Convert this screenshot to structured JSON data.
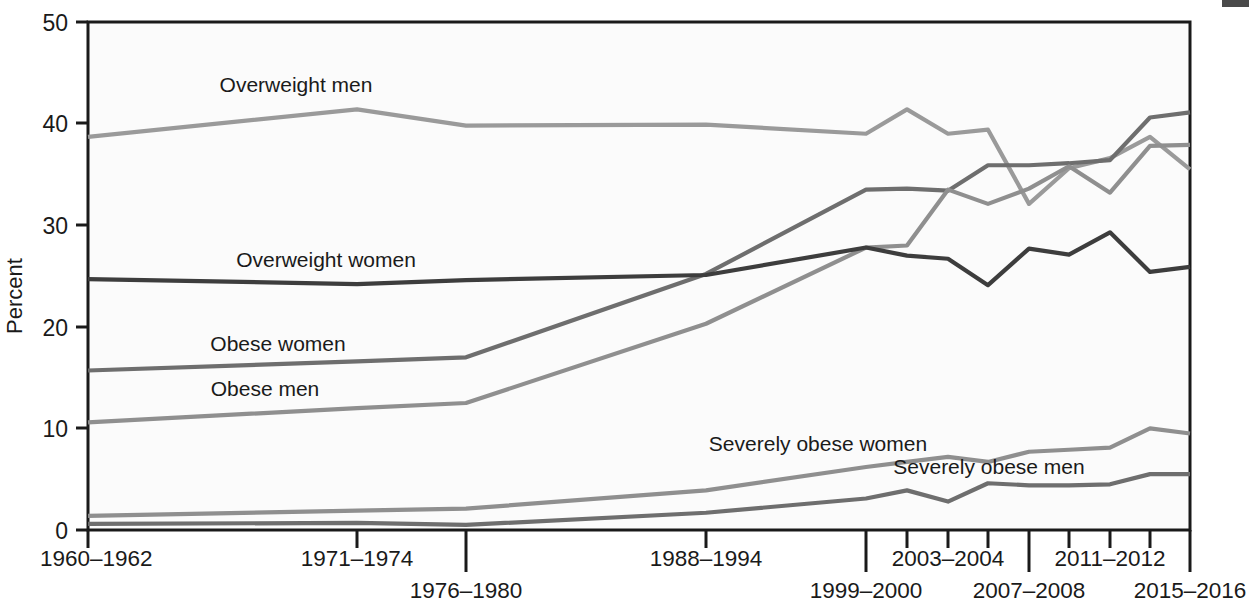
{
  "chart_data": {
    "type": "line",
    "title": "",
    "subtitle": "",
    "xlabel": "",
    "ylabel": "Percent",
    "ylim": [
      0,
      50
    ],
    "yticks": [
      0,
      10,
      20,
      30,
      40,
      50
    ],
    "ytick_labels": [
      "0",
      "10",
      "20",
      "30",
      "40",
      "50"
    ],
    "grid": false,
    "legend_position": "inline-labels",
    "x": [
      "1960-1962",
      "1971-1974",
      "1976-1980",
      "1988-1994",
      "1999-2000",
      "2001-2002",
      "2003-2004",
      "2005-2006",
      "2007-2008",
      "2009-2010",
      "2011-2012",
      "2013-2014",
      "2015-2016"
    ],
    "xtick_labels": [
      "1960–1962",
      "1971–1974",
      "1976–1980",
      "1988–1994",
      "1999–2000",
      "2003–2004",
      "2007–2008",
      "2011–2012",
      "2015–2016"
    ],
    "series": [
      {
        "name": "Overweight men",
        "label": "Overweight men",
        "color": "#9a9a9a",
        "values": [
          38.7,
          41.4,
          39.8,
          39.9,
          39.0,
          41.4,
          39.0,
          39.4,
          32.1,
          35.6,
          36.6,
          38.7,
          35.5
        ]
      },
      {
        "name": "Overweight women",
        "label": "Overweight women",
        "color": "#3d3d3d",
        "values": [
          24.7,
          24.2,
          24.6,
          25.1,
          27.8,
          27.0,
          26.7,
          24.1,
          27.7,
          27.1,
          29.3,
          25.4,
          25.9
        ]
      },
      {
        "name": "Obese women",
        "label": "Obese women",
        "color": "#6e6e6e",
        "values": [
          15.7,
          16.6,
          17.0,
          25.2,
          33.5,
          33.6,
          33.4,
          35.9,
          35.9,
          36.1,
          36.4,
          40.6,
          41.1
        ]
      },
      {
        "name": "Obese men",
        "label": "Obese men",
        "color": "#8f8f8f",
        "values": [
          10.6,
          12.0,
          12.5,
          20.3,
          27.8,
          28.0,
          33.5,
          32.1,
          33.6,
          35.8,
          33.2,
          37.8,
          37.9
        ]
      },
      {
        "name": "Severely obese women",
        "label": "Severely obese women",
        "color": "#8f8f8f",
        "values": [
          1.4,
          1.9,
          2.1,
          3.9,
          6.2,
          6.7,
          7.2,
          6.7,
          7.7,
          7.9,
          8.1,
          10.0,
          9.5
        ]
      },
      {
        "name": "Severely obese men",
        "label": "Severely obese men",
        "color": "#6e6e6e",
        "values": [
          0.6,
          0.7,
          0.5,
          1.7,
          3.1,
          3.9,
          2.8,
          4.6,
          4.4,
          4.4,
          4.5,
          5.5,
          5.5
        ]
      }
    ],
    "annotations": [
      {
        "text": "Overweight men",
        "x": 296,
        "y": 92
      },
      {
        "text": "Overweight women",
        "x": 326,
        "y": 267
      },
      {
        "text": "Obese women",
        "x": 278,
        "y": 351
      },
      {
        "text": "Obese men",
        "x": 265,
        "y": 396
      },
      {
        "text": "Severely obese women",
        "x": 818,
        "y": 451
      },
      {
        "text": "Severely obese men",
        "x": 989,
        "y": 474
      }
    ]
  },
  "axis": {
    "y_title": "Percent",
    "y_labels": [
      "50",
      "40",
      "30",
      "20",
      "10",
      "0"
    ],
    "x_labels_upper": [
      "1960–1962",
      "1971–1974",
      "1988–1994",
      "2003–2004",
      "2011–2012"
    ],
    "x_labels_lower": [
      "1976–1980",
      "1999–2000",
      "2007–2008",
      "2015–2016"
    ]
  },
  "xlabels": {
    "l0": "1960–1962",
    "l1": "1971–1974",
    "l2": "1976–1980",
    "l3": "1988–1994",
    "l4": "1999–2000",
    "l5": "2003–2004",
    "l6": "2007–2008",
    "l7": "2011–2012",
    "l8": "2015–2016"
  },
  "ylabels": {
    "y50": "50",
    "y40": "40",
    "y30": "30",
    "y20": "20",
    "y10": "10",
    "y0": "0"
  },
  "series_labels": {
    "overweight_men": "Overweight men",
    "overweight_women": "Overweight women",
    "obese_women": "Obese women",
    "obese_men": "Obese men",
    "severely_obese_women": "Severely obese women",
    "severely_obese_men": "Severely obese men"
  },
  "colors": {
    "overweight_men": "#9a9a9a",
    "overweight_women": "#3d3d3d",
    "obese_women": "#6e6e6e",
    "obese_men": "#8f8f8f",
    "severely_obese_women": "#8f8f8f",
    "severely_obese_men": "#6e6e6e",
    "axis": "#1a1a1a",
    "plot_bg": "#fbfbfb"
  }
}
